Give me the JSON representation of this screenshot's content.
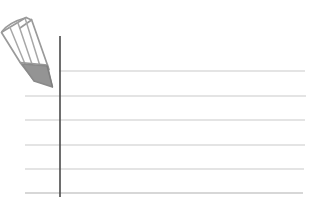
{
  "scene": {
    "title": "Ruled notebook paper with pencil",
    "width": 312,
    "height": 205,
    "background_color": "#ffffff",
    "caption": ""
  },
  "paper": {
    "name": "ruled-paper",
    "rule_color": "#c9c9c9",
    "rule_stroke_width": 1.1,
    "margin_line_color": "#4a4a4a",
    "margin_line_stroke_width": 1.6,
    "margin_line_x": 60,
    "margin_line_y_start": 36,
    "margin_line_y_end": 197,
    "line_count": 7,
    "lines": [
      {
        "label": "rule-1",
        "y": 45,
        "x_start": 0,
        "x_end": 305
      },
      {
        "label": "rule-2",
        "y": 71,
        "x_start": 59,
        "x_end": 305
      },
      {
        "label": "rule-3",
        "y": 96,
        "x_start": 25,
        "x_end": 306
      },
      {
        "label": "rule-4",
        "y": 120,
        "x_start": 25,
        "x_end": 305
      },
      {
        "label": "rule-5",
        "y": 145,
        "x_start": 25,
        "x_end": 305
      },
      {
        "label": "rule-6",
        "y": 169,
        "x_start": 25,
        "x_end": 304
      },
      {
        "label": "rule-7",
        "y": 193,
        "x_start": 25,
        "x_end": 303
      }
    ]
  },
  "pencil": {
    "name": "pencil-illustration",
    "outline_color": "#9a9a9a",
    "facet_line_color": "#a8a8a8",
    "tip_fill_color": "#949494",
    "tip_outline_color": "#8a8a8a",
    "body_fill_color": "#ffffff",
    "orientation": "diagonal-down-right",
    "description": "Outlined pencil pointing toward lower right with shaded graphite tip"
  }
}
